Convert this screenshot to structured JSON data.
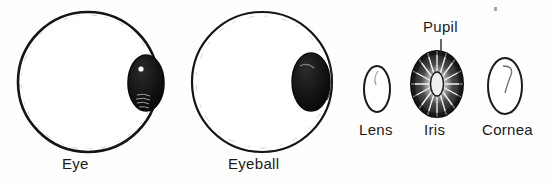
{
  "figure": {
    "background_color": "#fefefe",
    "ink_color": "#1a1a1a"
  },
  "labels": {
    "eye": "Eye",
    "eyeball": "Eyeball",
    "lens": "Lens",
    "iris": "Iris",
    "cornea": "Cornea",
    "pupil": "Pupil"
  },
  "parts": [
    {
      "name": "eye",
      "label": "Eye",
      "shape": "large-circle-with-dark-oval-on-right-edge",
      "has_highlight_dot": true
    },
    {
      "name": "eyeball",
      "label": "Eyeball",
      "shape": "large-circle-with-dark-oval-inside-right",
      "has_highlight_dot": false
    },
    {
      "name": "lens",
      "label": "Lens",
      "shape": "small-vertical-oval-outline"
    },
    {
      "name": "iris",
      "label": "Iris",
      "shape": "dark-oval-with-radial-striations-and-light-pupil"
    },
    {
      "name": "cornea",
      "label": "Cornea",
      "shape": "vertical-oval-outline-with-inner-curve"
    }
  ],
  "annotations": [
    {
      "name": "pupil-callout",
      "label": "Pupil",
      "points_to": "iris"
    }
  ]
}
